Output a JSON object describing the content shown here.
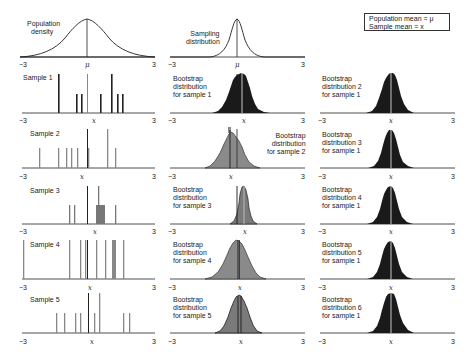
{
  "legend": {
    "line1": "Population mean = μ",
    "line2": "Sample mean = x"
  },
  "axis": {
    "min": "−3",
    "max": "3",
    "mu": "μ",
    "xbar": "x"
  },
  "top_row": {
    "population": {
      "label_line1": "Population",
      "label_line2": "density"
    },
    "sampling": {
      "label_line1": "Sampling",
      "label_line2": "distribution"
    }
  },
  "samples": [
    {
      "label": "Sample 1",
      "center_label": "x"
    },
    {
      "label": "Sample 2",
      "center_label": "x"
    },
    {
      "label": "Sample 3",
      "center_label": "x"
    },
    {
      "label": "Sample 4",
      "center_label": "x"
    },
    {
      "label": "Sample 5",
      "center_label": "x"
    }
  ],
  "bootstrap_middle": [
    {
      "line1": "Bootstrap",
      "line2": "distribution",
      "line3": "for sample 1"
    },
    {
      "line1": "Bootstrap",
      "line2": "distribution",
      "line3": "for sample 2"
    },
    {
      "line1": "Bootstrap",
      "line2": "distribution",
      "line3": "for sample 3"
    },
    {
      "line1": "Bootstrap",
      "line2": "distribution",
      "line3": "for sample 4"
    },
    {
      "line1": "Bootstrap",
      "line2": "distribution",
      "line3": "for sample 5"
    }
  ],
  "bootstrap_right": [
    {
      "line1": "Bootstrap",
      "line2": "distribution 2",
      "line3": "for sample 1"
    },
    {
      "line1": "Bootstrap",
      "line2": "distribution 3",
      "line3": "for sample 1"
    },
    {
      "line1": "Bootstrap",
      "line2": "distribution 4",
      "line3": "for sample 1"
    },
    {
      "line1": "Bootstrap",
      "line2": "distribution 5",
      "line3": "for sample 1"
    },
    {
      "line1": "Bootstrap",
      "line2": "distribution 6",
      "line3": "for sample 1"
    }
  ],
  "colors": {
    "dark": "#1a1a1a",
    "gray_fill": "#8a8a8a",
    "gray_bar": "#7a7a7a",
    "axis": "#222222"
  }
}
